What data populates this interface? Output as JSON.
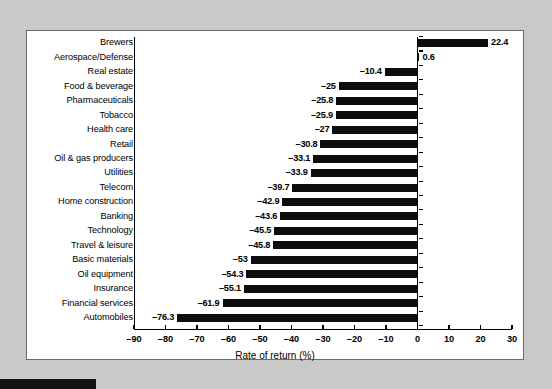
{
  "chart_data": {
    "type": "bar",
    "orientation": "horizontal",
    "title": "",
    "xlabel": "Rate of return (%)",
    "ylabel": "",
    "xlim": [
      -90,
      30
    ],
    "xticks": [
      "–90",
      "–80",
      "–70",
      "–60",
      "–50",
      "–40",
      "–30",
      "–20",
      "–10",
      "0",
      "10",
      "20",
      "30"
    ],
    "xtick_values": [
      -90,
      -80,
      -70,
      -60,
      -50,
      -40,
      -30,
      -20,
      -10,
      0,
      10,
      20,
      30
    ],
    "grid": false,
    "legend": false,
    "bar_color": "#0d0d0d",
    "categories": [
      "Brewers",
      "Aerospace/Defense",
      "Real estate",
      "Food & beverage",
      "Pharmaceuticals",
      "Tobacco",
      "Health care",
      "Retail",
      "Oil & gas producers",
      "Utilities",
      "Telecom",
      "Home construction",
      "Banking",
      "Technology",
      "Travel & leisure",
      "Basic materials",
      "Oil equipment",
      "Insurance",
      "Financial services",
      "Automobiles"
    ],
    "values": [
      22.4,
      0.6,
      -10.4,
      -25,
      -25.8,
      -25.9,
      -27,
      -30.8,
      -33.1,
      -33.9,
      -39.7,
      -42.9,
      -43.6,
      -45.5,
      -45.8,
      -53,
      -54.3,
      -55.1,
      -61.9,
      -76.3
    ],
    "value_labels": [
      "22.4",
      "0.6",
      "–10.4",
      "–25",
      "–25.8",
      "–25.9",
      "–27",
      "–30.8",
      "–33.1",
      "–33.9",
      "–39.7",
      "–42.9",
      "–43.6",
      "–45.5",
      "–45.8",
      "–53",
      "–54.3",
      "–55.1",
      "–61.9",
      "–76.3"
    ]
  },
  "page": {
    "background_color": "#c9c9c9",
    "panel_color": "#ffffff",
    "panel_border_color": "#6b6b6b"
  }
}
